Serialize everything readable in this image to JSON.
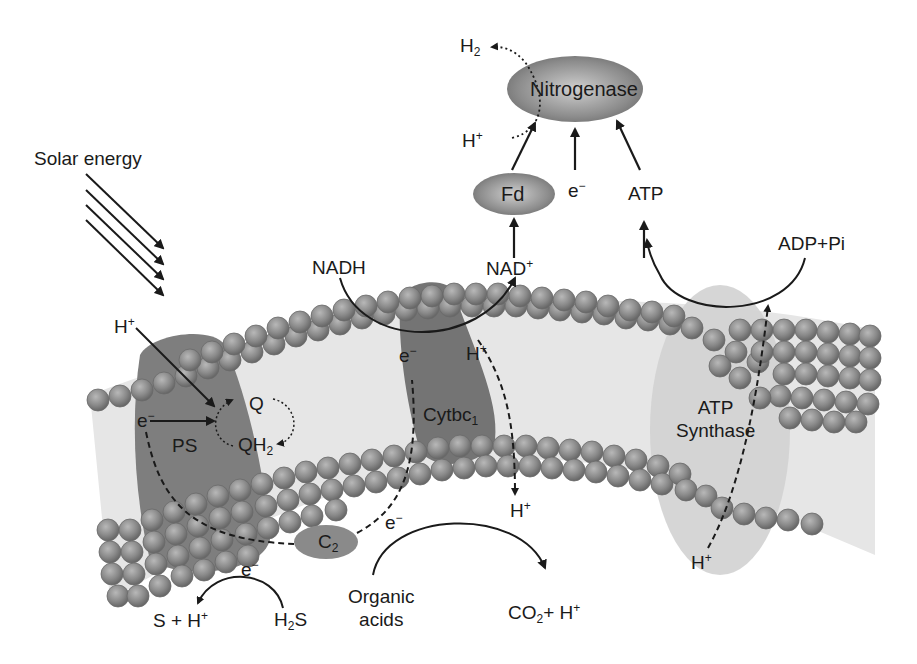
{
  "diagram": {
    "type": "photosynthetic electron transport and nitrogen fixation",
    "nodes": {
      "nitrogenase": {
        "label": "Nitrogenase"
      },
      "fd": {
        "label": "Fd"
      },
      "ps": {
        "label": "PS"
      },
      "cytbc1": {
        "label": "Cytbc",
        "subscript": "1"
      },
      "atp_synthase": {
        "line1": "ATP",
        "line2": "Synthase"
      },
      "c2": {
        "label": "C",
        "subscript": "2"
      }
    },
    "labels": {
      "solar_energy": "Solar energy",
      "h2": {
        "base": "H",
        "sub": "2"
      },
      "h_plus_nitrogenase": {
        "base": "H",
        "sup": "+"
      },
      "e_minus_top": {
        "base": "e",
        "sup": "−"
      },
      "atp_top": "ATP",
      "adp_pi": "ADP+Pi",
      "nadh": "NADH",
      "nad_plus": {
        "base": "NAD",
        "sup": "+"
      },
      "h_plus_ps": {
        "base": "H",
        "sup": "+"
      },
      "q": "Q",
      "qh2": {
        "base": "QH",
        "sub": "2"
      },
      "e_minus_ps": {
        "base": "e",
        "sup": "−"
      },
      "e_minus_cyt": {
        "base": "e",
        "sup": "−"
      },
      "h_plus_cyt": {
        "base": "H",
        "sup": "+"
      },
      "h_plus_cyt_out": {
        "base": "H",
        "sup": "+"
      },
      "e_minus_organic": {
        "base": "e",
        "sup": "−"
      },
      "e_minus_h2s": {
        "base": "e",
        "sup": "−"
      },
      "s_h_plus": {
        "base": "S + H",
        "sup": "+"
      },
      "h2s": {
        "base": "H",
        "sub": "2",
        "tail": "S"
      },
      "organic_acids": {
        "line1": "Organic",
        "line2": "acids"
      },
      "co2_h_plus": {
        "base": "CO",
        "sub": "2",
        "tail": "+ H",
        "sup": "+"
      },
      "h_plus_atp": {
        "base": "H",
        "sup": "+"
      }
    },
    "colors": {
      "protein": "#808080",
      "protein_dark": "#6e6e6e",
      "bead": "#8c8c8c",
      "membrane_bg": "#e6e6e6",
      "atp_synthase": "#cfcfcf",
      "ink": "#1a1a1a"
    }
  }
}
